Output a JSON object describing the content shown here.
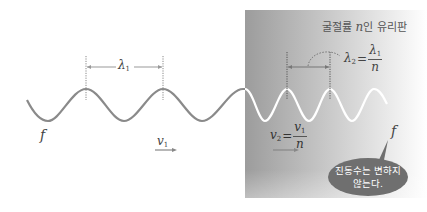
{
  "diagram": {
    "medium_label_prefix": "굴절률 ",
    "medium_label_var": "n",
    "medium_label_suffix": "인 유리판",
    "lambda1": {
      "symbol": "λ",
      "sub": "1"
    },
    "lambda2": {
      "symbol": "λ",
      "sub": "2",
      "eq": "=",
      "num_symbol": "λ",
      "num_sub": "1",
      "den": "n"
    },
    "v1": {
      "symbol": "v",
      "sub": "1"
    },
    "v2": {
      "symbol": "v",
      "sub": "2",
      "eq": "=",
      "num_symbol": "v",
      "num_sub": "1",
      "den": "n"
    },
    "f_left": "f",
    "f_right": "f",
    "bubble": {
      "line1": "진동수는 변하지",
      "line2": "않는다."
    },
    "colors": {
      "wave_air": "#8a8a8a",
      "wave_glass": "#ffffff",
      "glass_dark": "#9e9e9e",
      "glass_light": "#ffffff",
      "bubble": "#6f6f6f",
      "marker": "#8a8a8a"
    }
  }
}
